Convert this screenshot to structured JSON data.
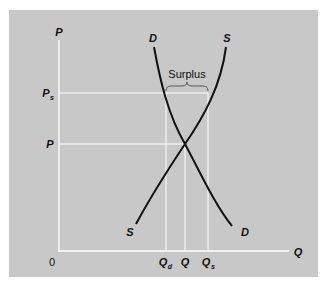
{
  "diagram": {
    "type": "supply-demand",
    "title": "",
    "axes": {
      "y_label": "P",
      "x_label": "Q",
      "origin_label": "0"
    },
    "price_levels": [
      {
        "label": "P",
        "subscript": "s",
        "meaning": "price above equilibrium"
      },
      {
        "label": "P",
        "subscript": "",
        "meaning": "equilibrium price"
      }
    ],
    "quantity_levels": [
      {
        "label": "Q",
        "subscript": "d"
      },
      {
        "label": "Q",
        "subscript": ""
      },
      {
        "label": "Q",
        "subscript": "s"
      }
    ],
    "curves": {
      "demand": {
        "label_top": "D",
        "label_bottom": "D"
      },
      "supply": {
        "label_top": "S",
        "label_bottom": "S"
      }
    },
    "annotation": "Surplus",
    "colors": {
      "panel": "#c8c8c8",
      "guides": "#ffffff",
      "curves": "#111111"
    }
  }
}
